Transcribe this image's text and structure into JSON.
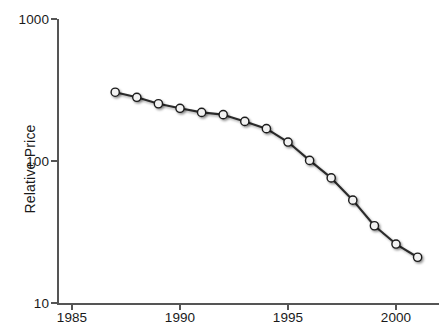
{
  "chart_data": {
    "type": "line",
    "title": "",
    "subtitle": "",
    "xlabel": "",
    "ylabel": "Relative Price",
    "xlim": [
      1983.5,
      2001.5
    ],
    "ylim": [
      10,
      1000
    ],
    "yscale": "log",
    "xscale": "linear",
    "grid": false,
    "legend": null,
    "xticks": [
      1985,
      1990,
      1995,
      2000
    ],
    "xtick_labels": [
      "1985",
      "1990",
      "1995",
      "2000"
    ],
    "yticks": [
      10,
      100,
      1000
    ],
    "ytick_labels": [
      "10",
      "100",
      "1000"
    ],
    "marker": "circle-open-white",
    "line_color": "#2b2b2b",
    "marker_face_color": "#f2f2f2",
    "marker_edge_color": "#1a1a1a",
    "x": [
      1987,
      1988,
      1989,
      1990,
      1991,
      1992,
      1993,
      1994,
      1995,
      1996,
      1997,
      1998,
      1999,
      2000,
      2001
    ],
    "values": [
      305,
      281,
      253,
      235,
      220,
      212,
      190,
      169,
      136,
      101,
      76,
      53,
      35,
      26,
      21
    ],
    "series": [
      {
        "name": "Relative Price",
        "x": [
          1987,
          1988,
          1989,
          1990,
          1991,
          1992,
          1993,
          1994,
          1995,
          1996,
          1997,
          1998,
          1999,
          2000,
          2001
        ],
        "values": [
          305,
          281,
          253,
          235,
          220,
          212,
          190,
          169,
          136,
          101,
          76,
          53,
          35,
          26,
          21
        ]
      }
    ],
    "annotations": []
  },
  "axes": {
    "y_title": "Relative Price",
    "y_ticks": [
      {
        "label": "1000",
        "value": 1000
      },
      {
        "label": "100",
        "value": 100
      },
      {
        "label": "10",
        "value": 10
      }
    ],
    "x_ticks": [
      {
        "label": "1985",
        "value": 1985
      },
      {
        "label": "1990",
        "value": 1990
      },
      {
        "label": "1995",
        "value": 1995
      },
      {
        "label": "2000",
        "value": 2000
      }
    ]
  },
  "colors": {
    "axis": "#555555",
    "line": "#2b2b2b",
    "marker_fill": "#f2f2f2",
    "marker_edge": "#1a1a1a",
    "text": "#1a1a1a",
    "background": "#ffffff"
  }
}
